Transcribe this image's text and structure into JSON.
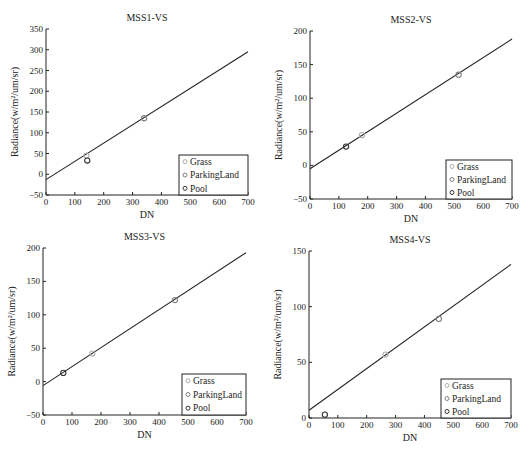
{
  "chart_data": [
    {
      "type": "scatter",
      "title": "MSS1-VS",
      "xlabel": "DN",
      "ylabel": "Radiance(w/m²/um/sr)",
      "xlim": [
        0,
        700
      ],
      "ylim": [
        -50,
        350
      ],
      "xticks": [
        0,
        100,
        200,
        300,
        400,
        500,
        600,
        700
      ],
      "yticks": [
        -50,
        0,
        50,
        100,
        150,
        200,
        250,
        300,
        350
      ],
      "fit_line": {
        "x": [
          0,
          700
        ],
        "y": [
          -13,
          295
        ]
      },
      "series": [
        {
          "name": "Grass",
          "color": "#b0b0b0",
          "points": [
            [
              140,
              45
            ]
          ]
        },
        {
          "name": "ParkingLand",
          "color": "#808080",
          "points": [
            [
              340,
              135
            ]
          ]
        },
        {
          "name": "Pool",
          "color": "#333333",
          "points": [
            [
              143,
              33
            ]
          ]
        }
      ],
      "legend": "bottom-right",
      "grid": false
    },
    {
      "type": "scatter",
      "title": "MSS2-VS",
      "xlabel": "DN",
      "ylabel": "Radiance(w/m²/um/sr)",
      "xlim": [
        0,
        700
      ],
      "ylim": [
        -50,
        200
      ],
      "xticks": [
        0,
        100,
        200,
        300,
        400,
        500,
        600,
        700
      ],
      "yticks": [
        -50,
        0,
        50,
        100,
        150,
        200
      ],
      "fit_line": {
        "x": [
          0,
          700
        ],
        "y": [
          -5,
          188
        ]
      },
      "series": [
        {
          "name": "Grass",
          "color": "#b0b0b0",
          "points": [
            [
              180,
              45
            ]
          ]
        },
        {
          "name": "ParkingLand",
          "color": "#808080",
          "points": [
            [
              515,
              135
            ]
          ]
        },
        {
          "name": "Pool",
          "color": "#333333",
          "points": [
            [
              125,
              28
            ]
          ]
        }
      ],
      "legend": "bottom-right",
      "grid": false
    },
    {
      "type": "scatter",
      "title": "MSS3-VS",
      "xlabel": "DN",
      "ylabel": "Radiance(w/m²/um/sr)",
      "xlim": [
        0,
        700
      ],
      "ylim": [
        -50,
        200
      ],
      "xticks": [
        0,
        100,
        200,
        300,
        400,
        500,
        600,
        700
      ],
      "yticks": [
        -50,
        0,
        50,
        100,
        150,
        200
      ],
      "fit_line": {
        "x": [
          0,
          700
        ],
        "y": [
          -6,
          193
        ]
      },
      "series": [
        {
          "name": "Grass",
          "color": "#b0b0b0",
          "points": [
            [
              170,
              42
            ]
          ]
        },
        {
          "name": "ParkingLand",
          "color": "#808080",
          "points": [
            [
              455,
              122
            ]
          ]
        },
        {
          "name": "Pool",
          "color": "#333333",
          "points": [
            [
              70,
              13
            ]
          ]
        }
      ],
      "legend": "bottom-right",
      "grid": false
    },
    {
      "type": "scatter",
      "title": "MSS4-VS",
      "xlabel": "DN",
      "ylabel": "Radiance(w/m²/um/sr)",
      "xlim": [
        0,
        700
      ],
      "ylim": [
        0,
        150
      ],
      "xticks": [
        0,
        100,
        200,
        300,
        400,
        500,
        600,
        700
      ],
      "yticks": [
        0,
        50,
        100,
        150
      ],
      "fit_line": {
        "x": [
          0,
          700
        ],
        "y": [
          7,
          138
        ]
      },
      "series": [
        {
          "name": "Grass",
          "color": "#b0b0b0",
          "points": [
            [
              265,
              57
            ]
          ]
        },
        {
          "name": "ParkingLand",
          "color": "#808080",
          "points": [
            [
              450,
              89
            ]
          ]
        },
        {
          "name": "Pool",
          "color": "#333333",
          "points": [
            [
              55,
              3
            ]
          ]
        }
      ],
      "legend": "bottom-right",
      "grid": false
    }
  ]
}
